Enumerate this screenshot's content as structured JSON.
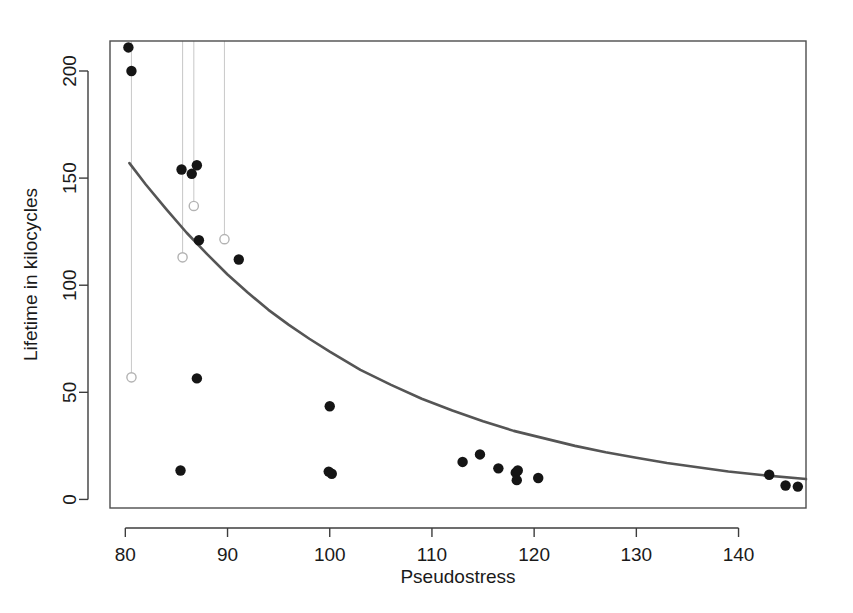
{
  "chart_data": {
    "type": "scatter",
    "title": "",
    "xlabel": "Pseudostress",
    "ylabel": "Lifetime in kilocycles",
    "xlim": [
      78.5,
      146.6
    ],
    "ylim": [
      -4,
      214
    ],
    "grid": false,
    "legend": null,
    "xticks": [
      80,
      90,
      100,
      110,
      120,
      130,
      140
    ],
    "xtick_labels": [
      "80",
      "90",
      "100",
      "110",
      "120",
      "130",
      "140"
    ],
    "yticks": [
      0,
      50,
      100,
      150,
      200
    ],
    "ytick_labels": [
      "0",
      "50",
      "100",
      "150",
      "200"
    ],
    "series": [
      {
        "name": "observed-failures",
        "marker": "filled-circle",
        "color": "#151515",
        "points": [
          {
            "x": 80.3,
            "y": 211.0
          },
          {
            "x": 80.6,
            "y": 200.0
          },
          {
            "x": 85.5,
            "y": 154.0
          },
          {
            "x": 86.5,
            "y": 152.0
          },
          {
            "x": 87.0,
            "y": 156.0
          },
          {
            "x": 87.2,
            "y": 121.0
          },
          {
            "x": 91.1,
            "y": 112.0
          },
          {
            "x": 87.0,
            "y": 56.5
          },
          {
            "x": 85.4,
            "y": 13.5
          },
          {
            "x": 99.9,
            "y": 13.0
          },
          {
            "x": 100.2,
            "y": 12.0
          },
          {
            "x": 100.0,
            "y": 43.5
          },
          {
            "x": 113.0,
            "y": 17.5
          },
          {
            "x": 114.7,
            "y": 21.0
          },
          {
            "x": 116.5,
            "y": 14.5
          },
          {
            "x": 118.2,
            "y": 12.5
          },
          {
            "x": 118.4,
            "y": 13.5
          },
          {
            "x": 118.3,
            "y": 9.0
          },
          {
            "x": 120.4,
            "y": 10.0
          },
          {
            "x": 143.0,
            "y": 11.5
          },
          {
            "x": 144.6,
            "y": 6.5
          },
          {
            "x": 145.8,
            "y": 6.0
          }
        ]
      },
      {
        "name": "censored-runouts",
        "marker": "open-circle",
        "color": "#b3b3b3",
        "points": [
          {
            "x": 80.6,
            "y": 57.0
          },
          {
            "x": 85.6,
            "y": 113.0
          },
          {
            "x": 86.7,
            "y": 137.0
          },
          {
            "x": 89.7,
            "y": 121.5
          }
        ]
      }
    ],
    "droplines": {
      "name": "censoring-droplines",
      "color": "#cccccc",
      "y_top": 214,
      "lines": [
        {
          "x": 80.6,
          "y_bottom": 57.0
        },
        {
          "x": 85.6,
          "y_bottom": 113.0
        },
        {
          "x": 86.7,
          "y_bottom": 137.0
        },
        {
          "x": 89.7,
          "y_bottom": 121.5
        }
      ]
    },
    "fitted_curve": {
      "name": "fitted-regression-curve",
      "color": "#555555",
      "x_start": 80.4,
      "x_end": 146.6,
      "y_start": 157.0,
      "y_end": 4.5,
      "model": "exponential-decay",
      "points": [
        {
          "x": 80.4,
          "y": 157.0
        },
        {
          "x": 82.0,
          "y": 147.0
        },
        {
          "x": 84.0,
          "y": 135.5
        },
        {
          "x": 86.0,
          "y": 124.5
        },
        {
          "x": 88.0,
          "y": 114.5
        },
        {
          "x": 90.0,
          "y": 105.0
        },
        {
          "x": 92.0,
          "y": 96.5
        },
        {
          "x": 94.0,
          "y": 88.5
        },
        {
          "x": 96.0,
          "y": 81.5
        },
        {
          "x": 98.0,
          "y": 75.0
        },
        {
          "x": 100.0,
          "y": 69.0
        },
        {
          "x": 103.0,
          "y": 60.5
        },
        {
          "x": 106.0,
          "y": 53.5
        },
        {
          "x": 109.0,
          "y": 47.0
        },
        {
          "x": 112.0,
          "y": 41.5
        },
        {
          "x": 115.0,
          "y": 36.5
        },
        {
          "x": 118.0,
          "y": 32.0
        },
        {
          "x": 121.0,
          "y": 28.5
        },
        {
          "x": 124.0,
          "y": 25.0
        },
        {
          "x": 127.0,
          "y": 22.0
        },
        {
          "x": 130.0,
          "y": 19.5
        },
        {
          "x": 133.0,
          "y": 17.0
        },
        {
          "x": 136.0,
          "y": 15.0
        },
        {
          "x": 139.0,
          "y": 13.0
        },
        {
          "x": 142.0,
          "y": 11.5
        },
        {
          "x": 146.6,
          "y": 9.5
        }
      ]
    }
  }
}
